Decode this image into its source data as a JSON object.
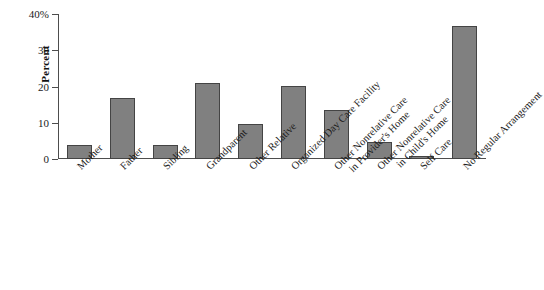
{
  "chart_data": {
    "type": "bar",
    "title": "",
    "subtitle": "",
    "xlabel": "",
    "ylabel": "Percent",
    "ylim": [
      0,
      40
    ],
    "yticks": [
      0,
      10,
      20,
      30,
      40
    ],
    "ytick_labels": [
      "0",
      "10",
      "20",
      "30",
      "40%"
    ],
    "grid": false,
    "legend": false,
    "bar_color": "#808080",
    "bar_edge_color": "#444444",
    "axis_color": "#4d4d4d",
    "categories": [
      "Mother",
      "Father",
      "Sibling",
      "Grandparent",
      "Other Relative",
      "Organized Day Care Facility",
      "Other Nonrelative Care in Provider's Home",
      "Other Nonrelative Care in Child's Home",
      "Self Care",
      "No Regular Arrangement"
    ],
    "category_lines": [
      [
        "Mother"
      ],
      [
        "Father"
      ],
      [
        "Sibling"
      ],
      [
        "Grandparent"
      ],
      [
        "Other Relative"
      ],
      [
        "Organized Day Care Facility"
      ],
      [
        "Other Nonrelative Care",
        "in Provider's Home"
      ],
      [
        "Other Nonrelative Care",
        "in Child's Home"
      ],
      [
        "Self Care"
      ],
      [
        "No Regular Arrangement"
      ]
    ],
    "values": [
      3.8,
      16.8,
      4.0,
      21.1,
      9.6,
      20.2,
      13.5,
      4.6,
      0.8,
      36.8
    ]
  }
}
